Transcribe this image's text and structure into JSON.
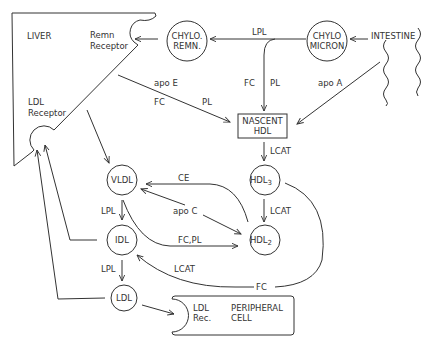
{
  "diagram": {
    "organs": {
      "liver": "LIVER",
      "intestine": "INTESTINE",
      "remn_receptor_line1": "Remn",
      "remn_receptor_line2": "Receptor",
      "ldl_receptor_line1": "LDL",
      "ldl_receptor_line2": "Receptor"
    },
    "nodes": {
      "chylo_remn_line1": "CHYLO.",
      "chylo_remn_line2": "REMN.",
      "chylomicron_line1": "CHYLO",
      "chylomicron_line2": "MICRON",
      "nascent_hdl_line1": "NASCENT",
      "nascent_hdl_line2": "HDL",
      "hdl3": "HDL",
      "hdl3_sub": "3",
      "hdl2": "HDL",
      "hdl2_sub": "2",
      "vldl": "VLDL",
      "idl": "IDL",
      "ldl": "LDL"
    },
    "peripheral_cell": {
      "rec_line1": "LDL",
      "rec_line2": "Rec.",
      "cell_line1": "PERIPHERAL",
      "cell_line2": "CELL"
    },
    "edge_labels": {
      "lpl_chylo": "LPL",
      "fc_chylo": "FC",
      "pl_chylo": "PL",
      "apo_a": "apo A",
      "apo_e": "apo E",
      "fc_liver": "FC",
      "pl_liver": "PL",
      "lcat_nascent": "LCAT",
      "lcat_hdl3": "LCAT",
      "ce": "CE",
      "apo_c": "apo C",
      "fc_pl": "FC,PL",
      "lpl_vldl": "LPL",
      "lpl_idl": "LPL",
      "lcat_idl": "LCAT",
      "fc_hdl3": "FC"
    },
    "colors": {
      "line": "#333333",
      "background": "#ffffff"
    }
  }
}
